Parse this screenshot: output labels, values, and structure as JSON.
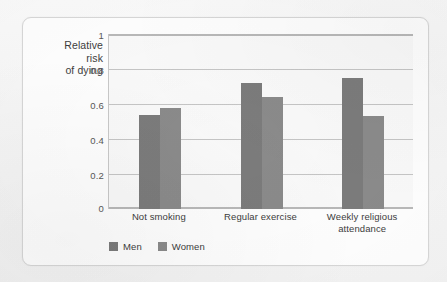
{
  "chart_data": {
    "type": "bar",
    "title": "",
    "xlabel": "",
    "ylabel": "Relative risk of dying",
    "ylabel_lines": [
      "Relative",
      "risk",
      "of dying"
    ],
    "categories": [
      "Not smoking",
      "Regular exercise",
      "Weekly religious attendance"
    ],
    "category_label_lines": [
      [
        "Not smoking"
      ],
      [
        "Regular exercise"
      ],
      [
        "Weekly religious",
        "attendance"
      ]
    ],
    "series": [
      {
        "name": "Men",
        "values": [
          0.54,
          0.72,
          0.75
        ],
        "color": "#7c7c7c"
      },
      {
        "name": "Women",
        "values": [
          0.58,
          0.64,
          0.53
        ],
        "color": "#8b8b8b"
      }
    ],
    "ylim": [
      0,
      1
    ],
    "yticks": [
      0,
      0.2,
      0.4,
      0.6,
      0.8,
      1
    ],
    "ytick_labels": [
      "0",
      "0.2",
      "0.4",
      "0.6",
      "0.8",
      "1"
    ],
    "grid": true,
    "grid_axis": "y",
    "legend_position": "bottom-left",
    "legend": [
      "Men",
      "Women"
    ]
  },
  "colors": {
    "men": "#7c7c7c",
    "women": "#8b8b8b",
    "gridline": "#c6c6c6",
    "axis": "#b9b9b9",
    "plot_background": "#fafafa",
    "card_background": "#ffffff",
    "page_background": "#f7f7f7",
    "text": "#3d3d3d"
  }
}
